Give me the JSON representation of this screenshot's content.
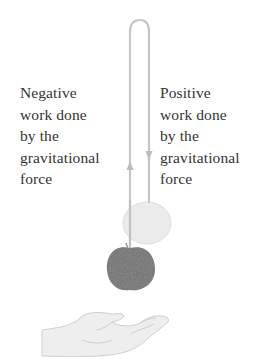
{
  "figure": {
    "left_label": {
      "lines": [
        "Negative",
        "work done",
        "by the",
        "gravitational",
        "force"
      ]
    },
    "right_label": {
      "lines": [
        "Positive",
        "work done",
        "by the",
        "gravitational",
        "force"
      ]
    },
    "elements": {
      "path": "up-and-down trajectory loop with arrows",
      "apple_start": "dark apple (lower position)",
      "apple_ghost": "faded apple (upper position)",
      "hand": "open hand"
    },
    "colors": {
      "path": "#c4c4c4",
      "text": "#333333",
      "apple_dark": "#6e6e6e",
      "apple_ghost": "#e6e6e6",
      "hand": "#dcdcdc"
    }
  }
}
